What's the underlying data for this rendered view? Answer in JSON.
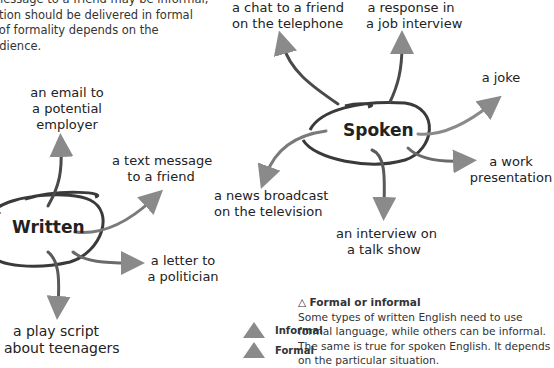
{
  "intro_text": {
    "lines": [
      "message to a friend may be informal,",
      "ation should be delivered in formal",
      "l of formality depends on the",
      "udience."
    ]
  },
  "written": {
    "hub_label": "Written",
    "items": [
      {
        "label_lines": [
          "an email to",
          "a potential",
          "employer"
        ]
      },
      {
        "label_lines": [
          "a text message",
          "to a friend"
        ]
      },
      {
        "label_lines": [
          "a letter to",
          "a politician"
        ]
      },
      {
        "label_lines": [
          "a play script",
          "about teenagers"
        ]
      }
    ]
  },
  "spoken": {
    "hub_label": "Spoken",
    "items": [
      {
        "label_lines": [
          "a chat to a friend",
          "on the telephone"
        ]
      },
      {
        "label_lines": [
          "a response in",
          "a job interview"
        ]
      },
      {
        "label_lines": [
          "a joke"
        ]
      },
      {
        "label_lines": [
          "a work",
          "presentation"
        ]
      },
      {
        "label_lines": [
          "a news broadcast",
          "on the television"
        ]
      },
      {
        "label_lines": [
          "an interview on",
          "a talk show"
        ]
      }
    ]
  },
  "legend": {
    "items": [
      {
        "label": "Informal",
        "icon": "triangle-up-icon",
        "color": "#8a8a8a"
      },
      {
        "label": "Formal",
        "icon": "triangle-up-icon",
        "color": "#8a8a8a"
      }
    ]
  },
  "note": {
    "icon": "△",
    "title": "Formal or informal",
    "lines": [
      "Some types of written English need to use",
      "formal language, while others can be informal.",
      "The same is true for spoken English. It depends",
      "on the particular situation."
    ]
  },
  "colors": {
    "ellipse": "#3a3a3a",
    "arrow": "#8a8a8a",
    "text": "#222222"
  }
}
